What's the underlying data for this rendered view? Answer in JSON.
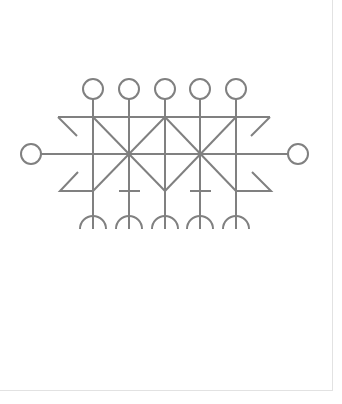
{
  "diagram": {
    "type": "symbol",
    "stroke_color": "#808080",
    "background": "#ffffff",
    "columns_x": [
      93,
      129,
      165,
      200,
      236
    ],
    "top_circles": {
      "y": 89,
      "r": 10
    },
    "side_circles": [
      {
        "cx": 31,
        "cy": 154,
        "r": 10
      },
      {
        "cx": 298,
        "cy": 154,
        "r": 10
      }
    ],
    "rails": {
      "top_y": 117,
      "middle_y": 154,
      "bottom_y": 191
    },
    "crossbars_x": [
      129,
      200
    ],
    "arcs": {
      "top_y": 215,
      "bottom_y": 229,
      "r": 13
    },
    "crossing_points": [
      {
        "x": 129,
        "y": 154
      },
      {
        "x": 200,
        "y": 154
      }
    ]
  }
}
